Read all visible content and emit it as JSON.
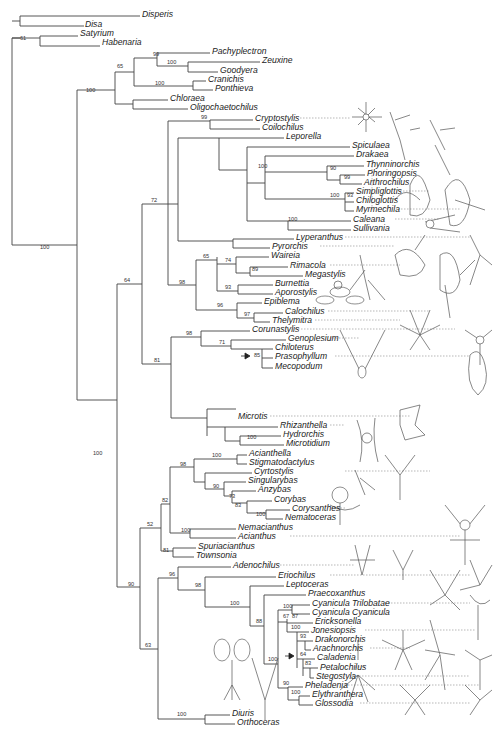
{
  "figure": {
    "type": "phylogenetic-tree",
    "line_color": "#444444",
    "background": "#ffffff"
  },
  "taxa": [
    {
      "name": "Disperis",
      "x": 142,
      "y": 14
    },
    {
      "name": "Disa",
      "x": 85,
      "y": 24
    },
    {
      "name": "Satyrium",
      "x": 80,
      "y": 33
    },
    {
      "name": "Habenaria",
      "x": 102,
      "y": 42
    },
    {
      "name": "Pachyplectron",
      "x": 212,
      "y": 51
    },
    {
      "name": "Zeuxine",
      "x": 262,
      "y": 60
    },
    {
      "name": "Goodyera",
      "x": 220,
      "y": 70
    },
    {
      "name": "Cranichis",
      "x": 208,
      "y": 79
    },
    {
      "name": "Ponthieva",
      "x": 215,
      "y": 88
    },
    {
      "name": "Chloraea",
      "x": 170,
      "y": 98
    },
    {
      "name": "Oligochaetochilus",
      "x": 190,
      "y": 107
    },
    {
      "name": "Cryptostylis",
      "x": 255,
      "y": 118
    },
    {
      "name": "Coilochilus",
      "x": 262,
      "y": 127
    },
    {
      "name": "Leporella",
      "x": 286,
      "y": 136
    },
    {
      "name": "Spiculaea",
      "x": 352,
      "y": 145
    },
    {
      "name": "Drakaea",
      "x": 356,
      "y": 154
    },
    {
      "name": "Thynninorchis",
      "x": 366,
      "y": 164
    },
    {
      "name": "Phoringopsis",
      "x": 367,
      "y": 173
    },
    {
      "name": "Arthrochilus",
      "x": 364,
      "y": 182
    },
    {
      "name": "Simpliglottis",
      "x": 356,
      "y": 191
    },
    {
      "name": "Chiloglottis",
      "x": 356,
      "y": 200
    },
    {
      "name": "Myrmechila",
      "x": 356,
      "y": 209
    },
    {
      "name": "Caleana",
      "x": 353,
      "y": 219
    },
    {
      "name": "Sullivania",
      "x": 353,
      "y": 228
    },
    {
      "name": "Lyperanthus",
      "x": 296,
      "y": 237
    },
    {
      "name": "Pyrorchis",
      "x": 272,
      "y": 246
    },
    {
      "name": "Waireia",
      "x": 271,
      "y": 255
    },
    {
      "name": "Rimacola",
      "x": 290,
      "y": 265
    },
    {
      "name": "Megastylis",
      "x": 305,
      "y": 274
    },
    {
      "name": "Burnettia",
      "x": 275,
      "y": 283
    },
    {
      "name": "Aporostylis",
      "x": 275,
      "y": 292
    },
    {
      "name": "Epiblema",
      "x": 264,
      "y": 301
    },
    {
      "name": "Calochilus",
      "x": 285,
      "y": 311
    },
    {
      "name": "Thelymitra",
      "x": 272,
      "y": 320
    },
    {
      "name": "Corunastylis",
      "x": 252,
      "y": 329
    },
    {
      "name": "Genoplesium",
      "x": 288,
      "y": 338
    },
    {
      "name": "Chiloterus",
      "x": 275,
      "y": 347
    },
    {
      "name": "Prasophyllum",
      "x": 275,
      "y": 356
    },
    {
      "name": "Mecopodum",
      "x": 275,
      "y": 366
    },
    {
      "name": "Microtis",
      "x": 238,
      "y": 416
    },
    {
      "name": "Rhizanthella",
      "x": 280,
      "y": 425
    },
    {
      "name": "Hydrorchis",
      "x": 283,
      "y": 434
    },
    {
      "name": "Microtidium",
      "x": 286,
      "y": 443
    },
    {
      "name": "Acianthella",
      "x": 249,
      "y": 453
    },
    {
      "name": "Stigmatodactylus",
      "x": 249,
      "y": 462
    },
    {
      "name": "Cyrtostylis",
      "x": 254,
      "y": 471
    },
    {
      "name": "Singularybas",
      "x": 248,
      "y": 480
    },
    {
      "name": "Anzybas",
      "x": 258,
      "y": 489
    },
    {
      "name": "Corybas",
      "x": 274,
      "y": 499
    },
    {
      "name": "Corysanthes",
      "x": 292,
      "y": 508
    },
    {
      "name": "Nematoceras",
      "x": 285,
      "y": 517
    },
    {
      "name": "Nemacianthus",
      "x": 238,
      "y": 527
    },
    {
      "name": "Acianthus",
      "x": 238,
      "y": 536
    },
    {
      "name": "Spuriacianthus",
      "x": 198,
      "y": 546
    },
    {
      "name": "Townsonia",
      "x": 196,
      "y": 555
    },
    {
      "name": "Adenochilus",
      "x": 233,
      "y": 565
    },
    {
      "name": "Eriochilus",
      "x": 278,
      "y": 575
    },
    {
      "name": "Leptoceras",
      "x": 286,
      "y": 584
    },
    {
      "name": "Praecoxanthus",
      "x": 308,
      "y": 593
    },
    {
      "name": "Cyanicula Trilobatae",
      "x": 312,
      "y": 603
    },
    {
      "name": "Cyanicula Cyanicula",
      "x": 312,
      "y": 612
    },
    {
      "name": "Ericksonella",
      "x": 315,
      "y": 621
    },
    {
      "name": "Jonesiopsis",
      "x": 311,
      "y": 630
    },
    {
      "name": "Drakonorchis",
      "x": 315,
      "y": 639
    },
    {
      "name": "Arachnorchis",
      "x": 313,
      "y": 648
    },
    {
      "name": "Caladenia",
      "x": 317,
      "y": 657
    },
    {
      "name": "Petalochilus",
      "x": 320,
      "y": 667
    },
    {
      "name": "Stegostyla",
      "x": 316,
      "y": 676
    },
    {
      "name": "Pheladenia",
      "x": 305,
      "y": 685
    },
    {
      "name": "Elythranthera",
      "x": 312,
      "y": 694
    },
    {
      "name": "Glossodia",
      "x": 315,
      "y": 703
    },
    {
      "name": "Diuris",
      "x": 232,
      "y": 713
    },
    {
      "name": "Orthoceras",
      "x": 237,
      "y": 722
    }
  ],
  "bootstrap": [
    {
      "value": "61",
      "x": 20,
      "y": 40
    },
    {
      "value": "99",
      "x": 153,
      "y": 56
    },
    {
      "value": "100",
      "x": 167,
      "y": 64
    },
    {
      "value": "65",
      "x": 117,
      "y": 68
    },
    {
      "value": "100",
      "x": 155,
      "y": 85
    },
    {
      "value": "100",
      "x": 86,
      "y": 92
    },
    {
      "value": "99",
      "x": 201,
      "y": 119
    },
    {
      "value": "100",
      "x": 258,
      "y": 168
    },
    {
      "value": "90",
      "x": 330,
      "y": 170
    },
    {
      "value": "99",
      "x": 344,
      "y": 179
    },
    {
      "value": "100",
      "x": 330,
      "y": 197
    },
    {
      "value": "93",
      "x": 347,
      "y": 197
    },
    {
      "value": "100",
      "x": 288,
      "y": 221
    },
    {
      "value": "72",
      "x": 151,
      "y": 202
    },
    {
      "value": "65",
      "x": 203,
      "y": 258
    },
    {
      "value": "74",
      "x": 225,
      "y": 262
    },
    {
      "value": "89",
      "x": 252,
      "y": 271
    },
    {
      "value": "98",
      "x": 179,
      "y": 284
    },
    {
      "value": "93",
      "x": 225,
      "y": 289
    },
    {
      "value": "96",
      "x": 217,
      "y": 307
    },
    {
      "value": "97",
      "x": 244,
      "y": 316
    },
    {
      "value": "64",
      "x": 124,
      "y": 282
    },
    {
      "value": "100",
      "x": 40,
      "y": 249
    },
    {
      "value": "98",
      "x": 186,
      "y": 335
    },
    {
      "value": "71",
      "x": 219,
      "y": 344
    },
    {
      "value": "85",
      "x": 254,
      "y": 357
    },
    {
      "value": "81",
      "x": 154,
      "y": 362
    },
    {
      "value": "100",
      "x": 93,
      "y": 455
    },
    {
      "value": "100",
      "x": 247,
      "y": 439
    },
    {
      "value": "100",
      "x": 212,
      "y": 457
    },
    {
      "value": "98",
      "x": 180,
      "y": 466
    },
    {
      "value": "90",
      "x": 213,
      "y": 488
    },
    {
      "value": "73",
      "x": 229,
      "y": 498
    },
    {
      "value": "83",
      "x": 235,
      "y": 507
    },
    {
      "value": "100",
      "x": 256,
      "y": 516
    },
    {
      "value": "82",
      "x": 162,
      "y": 502
    },
    {
      "value": "100",
      "x": 181,
      "y": 532
    },
    {
      "value": "52",
      "x": 147,
      "y": 526
    },
    {
      "value": "81",
      "x": 163,
      "y": 552
    },
    {
      "value": "90",
      "x": 128,
      "y": 586
    },
    {
      "value": "96",
      "x": 169,
      "y": 576
    },
    {
      "value": "98",
      "x": 195,
      "y": 587
    },
    {
      "value": "100",
      "x": 230,
      "y": 605
    },
    {
      "value": "88",
      "x": 256,
      "y": 623
    },
    {
      "value": "100",
      "x": 283,
      "y": 608
    },
    {
      "value": "67",
      "x": 283,
      "y": 618
    },
    {
      "value": "87",
      "x": 292,
      "y": 618
    },
    {
      "value": "100",
      "x": 291,
      "y": 629
    },
    {
      "value": "93",
      "x": 300,
      "y": 638
    },
    {
      "value": "64",
      "x": 300,
      "y": 656
    },
    {
      "value": "83",
      "x": 305,
      "y": 665
    },
    {
      "value": "100",
      "x": 268,
      "y": 661
    },
    {
      "value": "90",
      "x": 283,
      "y": 685
    },
    {
      "value": "100",
      "x": 291,
      "y": 694
    },
    {
      "value": "63",
      "x": 145,
      "y": 647
    },
    {
      "value": "100",
      "x": 177,
      "y": 716
    }
  ],
  "markers": [
    {
      "type": "arrow-right",
      "x": 250,
      "y": 356
    },
    {
      "type": "arrow-right",
      "x": 294,
      "y": 656
    }
  ]
}
